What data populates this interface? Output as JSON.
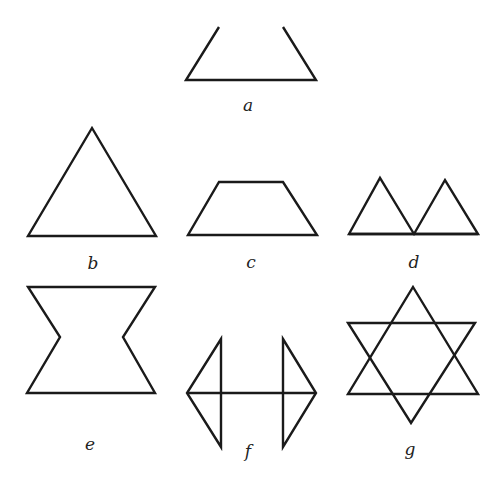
{
  "figure": {
    "background": "#ffffff",
    "stroke_color": "#1a1a1a",
    "panels": [
      {
        "id": "a",
        "label": "a",
        "description": "open trapezoid (no top edge)",
        "paths": [
          "M219,27 L186,80 L316,80 L283,27"
        ],
        "label_pos": [
          248,
          111
        ]
      },
      {
        "id": "b",
        "label": "b",
        "description": "equilateral triangle",
        "paths": [
          "M92,128 L28,236 L156,236 Z"
        ],
        "label_pos": [
          93,
          269
        ]
      },
      {
        "id": "c",
        "label": "c",
        "description": "trapezoid",
        "paths": [
          "M219,182 L283,182 L317,235 L188,235 Z"
        ],
        "label_pos": [
          251,
          268
        ]
      },
      {
        "id": "d",
        "label": "d",
        "description": "two adjacent triangles sharing a base line",
        "paths": [
          "M349,234 L380,178 L414,234 L445,180 L478,234 Z",
          "M349,234 L478,234"
        ],
        "label_pos": [
          414,
          268
        ]
      },
      {
        "id": "e",
        "label": "e",
        "description": "hourglass / bowtie hexagon",
        "paths": [
          "M28,287 L155,287 L123,337 L155,393 L27,393 L60,337 Z"
        ],
        "label_pos": [
          90,
          450
        ]
      },
      {
        "id": "f",
        "label": "f",
        "description": "two triangles connected by a horizontal line",
        "paths": [
          "M221,339 L187,393 L221,447 Z",
          "M283,339 L316,393 L283,447 Z",
          "M187,393 L316,393"
        ],
        "label_pos": [
          248,
          457
        ]
      },
      {
        "id": "g",
        "label": "g",
        "description": "six-pointed star (hexagram)",
        "paths": [
          "M413,287 L478,394 L348,394 Z",
          "M348,323 L475,323 L411,423 Z"
        ],
        "label_pos": [
          410,
          455
        ]
      }
    ]
  }
}
